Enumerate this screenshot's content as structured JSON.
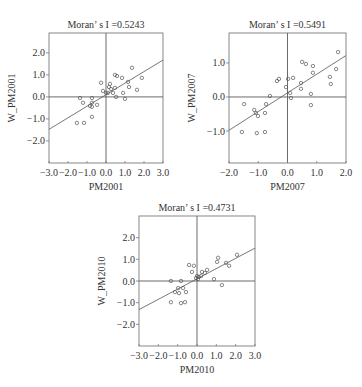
{
  "chart_data": [
    {
      "type": "scatter",
      "title": "Moran’ s  I =0.5243",
      "moran_i": 0.5243,
      "xlabel": "PM2001",
      "ylabel": "W_PM2001",
      "xlim": [
        -3.0,
        3.0
      ],
      "ylim": [
        -3.0,
        2.9
      ],
      "xticks": [
        -3.0,
        -2.0,
        -1.0,
        0.0,
        1.0,
        2.0,
        3.0
      ],
      "xtick_labels": [
        "−3.0",
        "−2.0",
        "−1.0",
        "0.0",
        "1.0",
        "2.0",
        "3.0"
      ],
      "yticks": [
        2.0,
        1.0,
        0.0,
        -1.0,
        -2.0
      ],
      "ytick_labels": [
        "2.0",
        "1.0",
        "0.0",
        "−1.0",
        "−2.0"
      ],
      "fit_line": {
        "slope": 0.5243,
        "intercept": 0.1
      },
      "grid": false,
      "frame": {
        "x": 49,
        "y": 33,
        "w": 114,
        "h": 130
      },
      "points": [
        [
          1.37,
          1.32
        ],
        [
          0.47,
          1.0
        ],
        [
          0.58,
          0.95
        ],
        [
          0.84,
          0.86
        ],
        [
          1.89,
          0.86
        ],
        [
          -0.26,
          0.64
        ],
        [
          0.21,
          0.59
        ],
        [
          0.16,
          0.45
        ],
        [
          1.16,
          0.68
        ],
        [
          1.21,
          0.45
        ],
        [
          0.47,
          0.41
        ],
        [
          1.63,
          0.32
        ],
        [
          -0.16,
          0.27
        ],
        [
          0.26,
          0.36
        ],
        [
          0.0,
          0.18
        ],
        [
          0.1,
          0.18
        ],
        [
          0.37,
          0.18
        ],
        [
          0.9,
          0.18
        ],
        [
          0.53,
          0.0
        ],
        [
          1.0,
          -0.09
        ],
        [
          -1.37,
          -0.05
        ],
        [
          -0.74,
          -0.05
        ],
        [
          -1.21,
          -0.27
        ],
        [
          -0.74,
          -0.27
        ],
        [
          -0.84,
          -0.41
        ],
        [
          -0.74,
          -0.45
        ],
        [
          -0.47,
          -0.36
        ],
        [
          -0.74,
          -0.91
        ],
        [
          -1.53,
          -1.18
        ],
        [
          -1.16,
          -1.18
        ]
      ]
    },
    {
      "type": "scatter",
      "title": "Moran’ s  I =0.5491",
      "moran_i": 0.5491,
      "xlabel": "PM2007",
      "ylabel": "W_PM2007",
      "xlim": [
        -2.0,
        2.0
      ],
      "ylim": [
        -1.94,
        1.88
      ],
      "xticks": [
        -2.0,
        -1.0,
        0.0,
        1.0,
        2.0
      ],
      "xtick_labels": [
        "−2.0",
        "−1.0",
        "0.0",
        "1.0",
        "2.0"
      ],
      "yticks": [
        1.0,
        0.0,
        -1.0
      ],
      "ytick_labels": [
        "1.0",
        "0.0",
        "−1.0"
      ],
      "fit_line": {
        "slope": 0.5491,
        "intercept": 0.12
      },
      "grid": false,
      "frame": {
        "x": 229,
        "y": 33,
        "w": 117,
        "h": 130
      },
      "points": [
        [
          1.73,
          1.32
        ],
        [
          0.5,
          1.03
        ],
        [
          0.63,
          0.97
        ],
        [
          0.87,
          0.91
        ],
        [
          1.66,
          0.82
        ],
        [
          0.87,
          0.71
        ],
        [
          -0.36,
          0.47
        ],
        [
          -0.29,
          0.53
        ],
        [
          0.02,
          0.53
        ],
        [
          0.19,
          0.56
        ],
        [
          1.45,
          0.59
        ],
        [
          1.48,
          0.38
        ],
        [
          0.46,
          0.41
        ],
        [
          -0.05,
          0.29
        ],
        [
          0.46,
          0.24
        ],
        [
          0.09,
          0.12
        ],
        [
          0.12,
          -0.03
        ],
        [
          0.8,
          0.09
        ],
        [
          -0.6,
          0.03
        ],
        [
          -1.48,
          -0.21
        ],
        [
          -0.73,
          -0.21
        ],
        [
          0.8,
          -0.24
        ],
        [
          -1.14,
          -0.38
        ],
        [
          -1.08,
          -0.47
        ],
        [
          -1.01,
          -0.56
        ],
        [
          -0.77,
          -0.47
        ],
        [
          -1.56,
          -1.03
        ],
        [
          -1.05,
          -1.06
        ],
        [
          -0.77,
          -1.03
        ]
      ]
    },
    {
      "type": "scatter",
      "title": "Moran’ s  I =0.4731",
      "moran_i": 0.4731,
      "xlabel": "PM2010",
      "ylabel": "W_PM2010",
      "xlim": [
        -3.0,
        3.0
      ],
      "ylim": [
        -3.0,
        3.0
      ],
      "xticks": [
        -3.0,
        -2.0,
        -1.0,
        0.0,
        1.0,
        2.0,
        3.0
      ],
      "xtick_labels": [
        "−3.0",
        "−2.0",
        "−1.0",
        "0.0",
        "1.0",
        "2.0",
        "3.0"
      ],
      "yticks": [
        2.0,
        1.0,
        0.0,
        -1.0,
        -2.0
      ],
      "ytick_labels": [
        "2.0",
        "1.0",
        "0.0",
        "−1.0",
        "−2.0"
      ],
      "fit_line": {
        "slope": 0.4731,
        "intercept": 0.1
      },
      "grid": false,
      "frame": {
        "x": 139,
        "y": 216,
        "w": 116,
        "h": 130
      },
      "points": [
        [
          2.07,
          1.21
        ],
        [
          1.09,
          1.07
        ],
        [
          1.04,
          0.88
        ],
        [
          1.5,
          0.84
        ],
        [
          1.66,
          0.7
        ],
        [
          -0.41,
          0.74
        ],
        [
          -0.16,
          0.7
        ],
        [
          -0.26,
          0.42
        ],
        [
          0.52,
          0.51
        ],
        [
          0.26,
          0.42
        ],
        [
          0.41,
          0.37
        ],
        [
          0.0,
          0.23
        ],
        [
          0.1,
          0.19
        ],
        [
          -0.05,
          0.14
        ],
        [
          0.21,
          0.23
        ],
        [
          0.05,
          0.09
        ],
        [
          0.88,
          0.09
        ],
        [
          1.29,
          -0.19
        ],
        [
          -1.35,
          0.0
        ],
        [
          -0.83,
          0.0
        ],
        [
          -0.98,
          -0.33
        ],
        [
          -0.72,
          -0.33
        ],
        [
          -1.14,
          -0.51
        ],
        [
          -0.93,
          -0.56
        ],
        [
          -0.57,
          -0.51
        ],
        [
          -1.35,
          -0.98
        ],
        [
          -0.83,
          -1.02
        ],
        [
          -0.62,
          -0.98
        ]
      ]
    }
  ]
}
